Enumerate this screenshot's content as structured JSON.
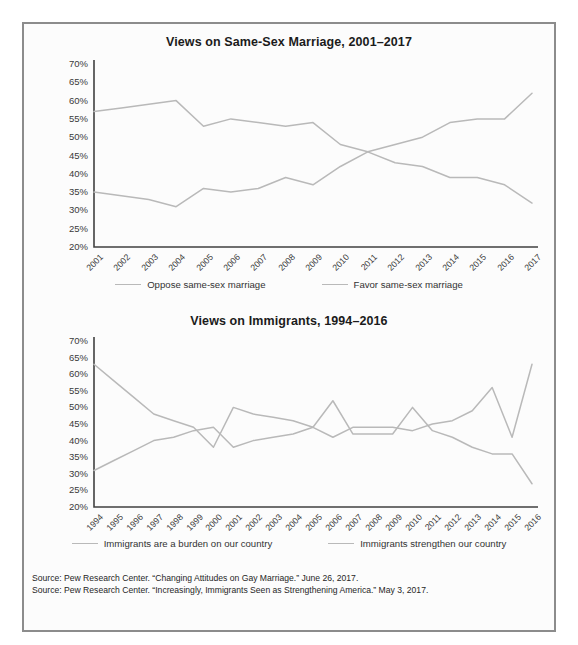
{
  "figure": {
    "background_color": "#fcfcfc",
    "border_color": "#8c8c8c",
    "line_color": "#b9b9b9",
    "axis_color": "#404040"
  },
  "charts": [
    {
      "id": "chart-1",
      "title": "Views on Same-Sex Marriage, 2001–2017",
      "legend": [
        {
          "label": "Oppose same-sex marriage",
          "color": "#b9b9b9"
        },
        {
          "label": "Favor same-sex marriage",
          "color": "#b9b9b9"
        }
      ]
    },
    {
      "id": "chart-2",
      "title": "Views on Immigrants, 1994–2016",
      "legend": [
        {
          "label": "Immigrants are a burden on our country",
          "color": "#b9b9b9"
        },
        {
          "label": "Immigrants strengthen our country",
          "color": "#b9b9b9"
        }
      ]
    }
  ],
  "source_notes": [
    "Source: Pew Research Center. “Changing Attitudes on Gay Marriage.” June 26, 2017.",
    "Source: Pew Research Center. “Increasingly, Immigrants Seen as Strengthening America.” May 3, 2017."
  ],
  "chart_data": [
    {
      "type": "line",
      "title": "Views on Same-Sex Marriage, 2001–2017",
      "xlabel": "",
      "ylabel": "",
      "ylim": [
        20,
        70
      ],
      "ytick_step": 5,
      "ytick_labels": [
        "70%",
        "65%",
        "60%",
        "55%",
        "50%",
        "45%",
        "40%",
        "35%",
        "30%",
        "25%",
        "20%"
      ],
      "grid": false,
      "legend_position": "bottom",
      "categories": [
        "2001",
        "2002",
        "2003",
        "2004",
        "2005",
        "2006",
        "2007",
        "2008",
        "2009",
        "2010",
        "2011",
        "2012",
        "2013",
        "2014",
        "2015",
        "2016",
        "2017"
      ],
      "series": [
        {
          "name": "Oppose same-sex marriage",
          "color": "#b9b9b9",
          "values": [
            57,
            58,
            59,
            60,
            53,
            55,
            54,
            53,
            54,
            48,
            46,
            43,
            42,
            39,
            39,
            37,
            32
          ]
        },
        {
          "name": "Favor same-sex marriage",
          "color": "#b9b9b9",
          "values": [
            35,
            34,
            33,
            31,
            36,
            35,
            36,
            39,
            37,
            42,
            46,
            48,
            50,
            54,
            55,
            55,
            62
          ]
        }
      ]
    },
    {
      "type": "line",
      "title": "Views on Immigrants, 1994–2016",
      "xlabel": "",
      "ylabel": "",
      "ylim": [
        20,
        70
      ],
      "ytick_step": 5,
      "ytick_labels": [
        "70%",
        "65%",
        "60%",
        "55%",
        "50%",
        "45%",
        "40%",
        "35%",
        "30%",
        "25%",
        "20%"
      ],
      "grid": false,
      "legend_position": "bottom",
      "categories": [
        "1994",
        "1995",
        "1996",
        "1997",
        "1998",
        "1999",
        "2000",
        "2001",
        "2002",
        "2003",
        "2004",
        "2005",
        "2006",
        "2007",
        "2008",
        "2009",
        "2010",
        "2011",
        "2012",
        "2013",
        "2014",
        "2015",
        "2016"
      ],
      "series": [
        {
          "name": "Immigrants are a burden on our country",
          "color": "#b9b9b9",
          "values": [
            63,
            58,
            53,
            48,
            46,
            44,
            38,
            50,
            48,
            47,
            46,
            44,
            52,
            42,
            42,
            42,
            50,
            43,
            41,
            38,
            36,
            36,
            27
          ]
        },
        {
          "name": "Immigrants strengthen our country",
          "color": "#b9b9b9",
          "values": [
            31,
            34,
            37,
            40,
            41,
            43,
            44,
            38,
            40,
            41,
            42,
            44,
            41,
            44,
            44,
            44,
            43,
            45,
            46,
            49,
            56,
            41,
            63
          ]
        }
      ]
    }
  ]
}
